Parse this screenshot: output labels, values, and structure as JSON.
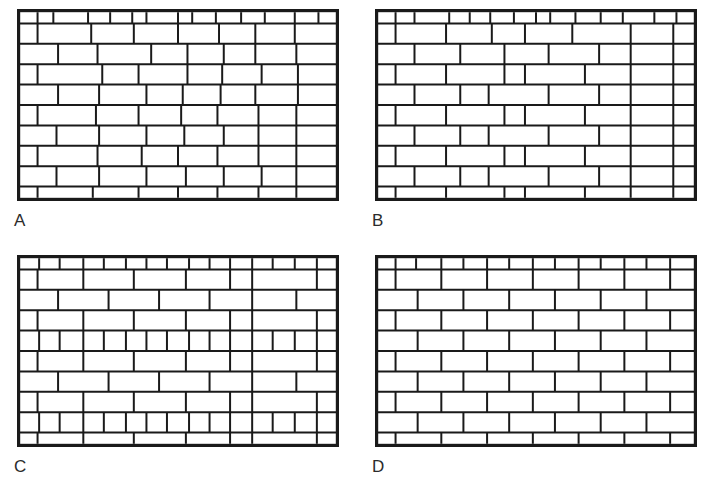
{
  "figure": {
    "background_color": "#ffffff",
    "ink_color": "#1a1a1a",
    "label_color": "#2b2b2b",
    "width": 713,
    "height": 490,
    "panel_count": 4
  },
  "panels": [
    {
      "id": "A",
      "label": "A",
      "x": 17,
      "y": 9,
      "width": 322,
      "height": 192,
      "label_x": 14,
      "label_y": 212,
      "border_width": 3.2,
      "mortar_width": 2.0,
      "rows": 10,
      "description": "irregular running bond with header course top and bottom",
      "courses": [
        {
          "type": "header",
          "height": 0.55,
          "joints": [
            0.055,
            0.105,
            0.215,
            0.285,
            0.355,
            0.4,
            0.5,
            0.545,
            0.62,
            0.7,
            0.775,
            0.87,
            0.945
          ]
        },
        {
          "type": "stretcher",
          "height": 1.0,
          "joints": [
            0.055,
            0.225,
            0.36,
            0.5,
            0.63,
            0.745,
            0.87
          ]
        },
        {
          "type": "stretcher",
          "height": 1.0,
          "joints": [
            0.12,
            0.245,
            0.415,
            0.53,
            0.645,
            0.745,
            0.875
          ]
        },
        {
          "type": "stretcher",
          "height": 1.0,
          "joints": [
            0.055,
            0.26,
            0.375,
            0.53,
            0.64,
            0.765,
            0.88
          ]
        },
        {
          "type": "stretcher",
          "height": 1.0,
          "joints": [
            0.12,
            0.25,
            0.4,
            0.515,
            0.635,
            0.745,
            0.88
          ]
        },
        {
          "type": "stretcher",
          "height": 1.0,
          "joints": [
            0.055,
            0.24,
            0.375,
            0.51,
            0.625,
            0.755,
            0.875
          ]
        },
        {
          "type": "stretcher",
          "height": 1.0,
          "joints": [
            0.115,
            0.25,
            0.4,
            0.52,
            0.645,
            0.755,
            0.875
          ]
        },
        {
          "type": "stretcher",
          "height": 1.0,
          "joints": [
            0.055,
            0.245,
            0.385,
            0.5,
            0.625,
            0.755,
            0.875
          ]
        },
        {
          "type": "stretcher",
          "height": 1.0,
          "joints": [
            0.115,
            0.25,
            0.4,
            0.525,
            0.645,
            0.765,
            0.875
          ]
        },
        {
          "type": "header",
          "height": 0.55,
          "joints": [
            0.055,
            0.23,
            0.375,
            0.5,
            0.625,
            0.755,
            0.875
          ]
        }
      ]
    },
    {
      "id": "B",
      "label": "B",
      "x": 375,
      "y": 9,
      "width": 322,
      "height": 192,
      "label_x": 372,
      "label_y": 212,
      "border_width": 3.2,
      "mortar_width": 2.0,
      "rows": 10,
      "description": "running bond with slightly irregular vertical joints",
      "courses": [
        {
          "type": "header",
          "height": 0.55,
          "joints": [
            0.055,
            0.115,
            0.225,
            0.29,
            0.355,
            0.43,
            0.5,
            0.545,
            0.625,
            0.705,
            0.775,
            0.875,
            0.945
          ]
        },
        {
          "type": "stretcher",
          "height": 1.0,
          "joints": [
            0.055,
            0.215,
            0.36,
            0.465,
            0.615,
            0.8,
            0.935
          ]
        },
        {
          "type": "stretcher",
          "height": 1.0,
          "joints": [
            0.115,
            0.26,
            0.4,
            0.54,
            0.7,
            0.8,
            0.935
          ]
        },
        {
          "type": "stretcher",
          "height": 1.0,
          "joints": [
            0.055,
            0.215,
            0.4,
            0.465,
            0.655,
            0.8,
            0.935
          ]
        },
        {
          "type": "stretcher",
          "height": 1.0,
          "joints": [
            0.115,
            0.26,
            0.35,
            0.54,
            0.7,
            0.8,
            0.935
          ]
        },
        {
          "type": "stretcher",
          "height": 1.0,
          "joints": [
            0.055,
            0.215,
            0.4,
            0.465,
            0.655,
            0.8,
            0.935
          ]
        },
        {
          "type": "stretcher",
          "height": 1.0,
          "joints": [
            0.115,
            0.26,
            0.35,
            0.54,
            0.7,
            0.8,
            0.935
          ]
        },
        {
          "type": "stretcher",
          "height": 1.0,
          "joints": [
            0.055,
            0.215,
            0.4,
            0.465,
            0.655,
            0.8,
            0.935
          ]
        },
        {
          "type": "stretcher",
          "height": 1.0,
          "joints": [
            0.115,
            0.26,
            0.35,
            0.54,
            0.7,
            0.8,
            0.935
          ]
        },
        {
          "type": "header",
          "height": 0.55,
          "joints": [
            0.055,
            0.215,
            0.4,
            0.465,
            0.655,
            0.8,
            0.935
          ]
        }
      ]
    },
    {
      "id": "C",
      "label": "C",
      "x": 17,
      "y": 255,
      "width": 322,
      "height": 192,
      "label_x": 14,
      "label_y": 458,
      "border_width": 3.2,
      "mortar_width": 2.0,
      "rows": 10,
      "description": "alternating stretcher and header courses with aligned straight joints at 74 percent width",
      "straight_joint_x": 0.735,
      "courses": [
        {
          "type": "header",
          "height": 0.55,
          "joints": [
            0.06,
            0.125,
            0.2,
            0.265,
            0.335,
            0.4,
            0.465,
            0.535,
            0.6,
            0.665,
            0.735,
            0.8,
            0.87,
            0.94
          ]
        },
        {
          "type": "stretcher",
          "height": 1.0,
          "joints": [
            0.055,
            0.2,
            0.36,
            0.525,
            0.665,
            0.735,
            0.94
          ]
        },
        {
          "type": "stretcher",
          "height": 1.0,
          "joints": [
            0.12,
            0.28,
            0.44,
            0.6,
            0.735,
            0.875
          ]
        },
        {
          "type": "stretcher",
          "height": 1.0,
          "joints": [
            0.055,
            0.2,
            0.36,
            0.525,
            0.665,
            0.735,
            0.94
          ]
        },
        {
          "type": "header",
          "height": 1.0,
          "joints": [
            0.06,
            0.125,
            0.2,
            0.265,
            0.335,
            0.4,
            0.465,
            0.535,
            0.6,
            0.665,
            0.735,
            0.8,
            0.87,
            0.94
          ]
        },
        {
          "type": "stretcher",
          "height": 1.0,
          "joints": [
            0.055,
            0.2,
            0.36,
            0.525,
            0.665,
            0.735,
            0.94
          ]
        },
        {
          "type": "stretcher",
          "height": 1.0,
          "joints": [
            0.12,
            0.28,
            0.44,
            0.6,
            0.735,
            0.875
          ]
        },
        {
          "type": "stretcher",
          "height": 1.0,
          "joints": [
            0.055,
            0.2,
            0.36,
            0.525,
            0.665,
            0.735,
            0.94
          ]
        },
        {
          "type": "header",
          "height": 1.0,
          "joints": [
            0.06,
            0.125,
            0.2,
            0.265,
            0.335,
            0.4,
            0.465,
            0.535,
            0.6,
            0.665,
            0.735,
            0.8,
            0.87,
            0.94
          ]
        },
        {
          "type": "header",
          "height": 0.55,
          "joints": [
            0.055,
            0.2,
            0.36,
            0.525,
            0.665,
            0.735,
            0.94
          ]
        }
      ]
    },
    {
      "id": "D",
      "label": "D",
      "x": 375,
      "y": 255,
      "width": 322,
      "height": 192,
      "label_x": 372,
      "label_y": 458,
      "border_width": 3.2,
      "mortar_width": 2.0,
      "rows": 10,
      "description": "regular running bond with uniform half brick offset",
      "courses": [
        {
          "type": "header",
          "height": 0.55,
          "joints": [
            0.055,
            0.12,
            0.2,
            0.27,
            0.345,
            0.415,
            0.49,
            0.56,
            0.635,
            0.705,
            0.78,
            0.85,
            0.925
          ]
        },
        {
          "type": "stretcher",
          "height": 1.0,
          "joints": [
            0.055,
            0.2,
            0.345,
            0.49,
            0.635,
            0.78,
            0.925
          ]
        },
        {
          "type": "stretcher",
          "height": 1.0,
          "joints": [
            0.125,
            0.27,
            0.415,
            0.56,
            0.705,
            0.85
          ]
        },
        {
          "type": "stretcher",
          "height": 1.0,
          "joints": [
            0.055,
            0.2,
            0.345,
            0.49,
            0.635,
            0.78,
            0.925
          ]
        },
        {
          "type": "stretcher",
          "height": 1.0,
          "joints": [
            0.125,
            0.27,
            0.415,
            0.56,
            0.705,
            0.85
          ]
        },
        {
          "type": "stretcher",
          "height": 1.0,
          "joints": [
            0.055,
            0.2,
            0.345,
            0.49,
            0.635,
            0.78,
            0.925
          ]
        },
        {
          "type": "stretcher",
          "height": 1.0,
          "joints": [
            0.125,
            0.27,
            0.415,
            0.56,
            0.705,
            0.85
          ]
        },
        {
          "type": "stretcher",
          "height": 1.0,
          "joints": [
            0.055,
            0.2,
            0.345,
            0.49,
            0.635,
            0.78,
            0.925
          ]
        },
        {
          "type": "stretcher",
          "height": 1.0,
          "joints": [
            0.125,
            0.27,
            0.415,
            0.56,
            0.705,
            0.85
          ]
        },
        {
          "type": "header",
          "height": 0.55,
          "joints": [
            0.055,
            0.2,
            0.345,
            0.49,
            0.635,
            0.78,
            0.925
          ]
        }
      ]
    }
  ]
}
